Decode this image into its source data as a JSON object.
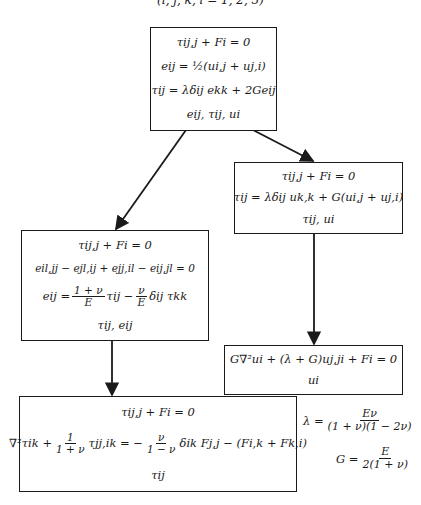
{
  "caption": "(i, j, k, l = 1, 2, 3)",
  "boxes": {
    "top": {
      "lines": [
        "τij,j + Fi = 0",
        "eij = ½(ui,j + uj,i)",
        "τij = λδij ekk + 2Geij",
        "eij,   τij,   ui"
      ]
    },
    "right_upper": {
      "lines": [
        "τij,j + Fi = 0",
        "τij = λδij uk,k + G(ui,j + uj,i)",
        "τij,   ui"
      ]
    },
    "left": {
      "lines": [
        "τij,j + Fi = 0",
        "eil,jj − ejl,ij + ejj,il − eij,jl = 0"
      ],
      "constitutive": {
        "lhs": "eij =",
        "frac1_num": "1 + ν",
        "frac1_den": "E",
        "mid": "τij −",
        "frac2_num": "ν",
        "frac2_den": "E",
        "tail": "δij τkk"
      },
      "unknowns": "τij, eij"
    },
    "right_lower": {
      "lines": [
        "G∇²ui + (λ + G)uj,ji + Fi = 0",
        "ui"
      ]
    },
    "bottom": {
      "line1": "τij,j + Fi = 0",
      "compat": {
        "a": "∇²τik +",
        "frac1_num": "1",
        "frac1_den": "1 + ν",
        "b": "τjj,ik = −",
        "frac2_num": "ν",
        "frac2_den": "1 − ν",
        "c": "δik Fj,j − (Fi,k + Fk,i)"
      },
      "unknowns": "τij"
    }
  },
  "side_formulas": {
    "lambda": {
      "lhs": "λ =",
      "num": "Eν",
      "den": "(1 + ν)(1 − 2ν)"
    },
    "G": {
      "lhs": "G =",
      "num": "E",
      "den": "2(1 + ν)"
    }
  },
  "colors": {
    "ink": "#1a1a1a",
    "background": "#ffffff"
  }
}
